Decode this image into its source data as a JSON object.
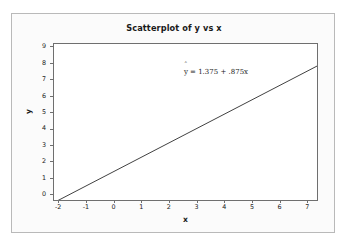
{
  "chart_data": {
    "type": "line",
    "title": "Scatterplot of y vs x",
    "xlabel": "x",
    "ylabel": "y",
    "xlim": [
      -2.15,
      7.35
    ],
    "ylim": [
      -0.35,
      9.15
    ],
    "xticks": [
      -2,
      -1,
      0,
      1,
      2,
      3,
      4,
      5,
      6,
      7
    ],
    "xtick_labels": [
      "-2",
      "-1",
      "0",
      "1",
      "2",
      "3",
      "4",
      "5",
      "6",
      "7"
    ],
    "yticks": [
      0,
      1,
      2,
      3,
      4,
      5,
      6,
      7,
      8,
      9
    ],
    "ytick_labels": [
      "0",
      "1",
      "2",
      "3",
      "4",
      "5",
      "6",
      "7",
      "8",
      "9"
    ],
    "grid": false,
    "legend": null,
    "annotation": {
      "text": "y = 1.375 + .875x",
      "hat_symbol": "ˆ",
      "y_symbol": "y",
      "equals_part": "= 1.375 + .875x",
      "x_position": 2.55,
      "y_position": 7.45
    },
    "series": [
      {
        "name": "fitted regression line",
        "type": "line",
        "equation": "y-hat = 1.375 + .875x",
        "intercept": 1.375,
        "slope": 0.875,
        "color": "#2b2b2b",
        "x": [
          -2.15,
          7.35
        ],
        "values": [
          -0.506,
          7.806
        ]
      }
    ]
  },
  "panel": {
    "background_color": "#fbfbfb",
    "border_color": "#b9b9b9"
  },
  "plot": {
    "frame_color": "#6f6f6f",
    "background_color": "#ffffff",
    "line_color": "#2b2b2b"
  }
}
